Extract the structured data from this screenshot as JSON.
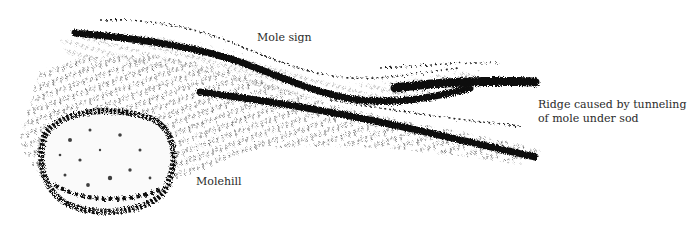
{
  "figure": {
    "ink_color": "#111111",
    "background_color": "#ffffff"
  },
  "labels": {
    "mole_sign": "Mole sign",
    "ridge_line1": "Ridge caused by tunneling",
    "ridge_line2": "of mole under sod",
    "molehill": "Molehill"
  }
}
